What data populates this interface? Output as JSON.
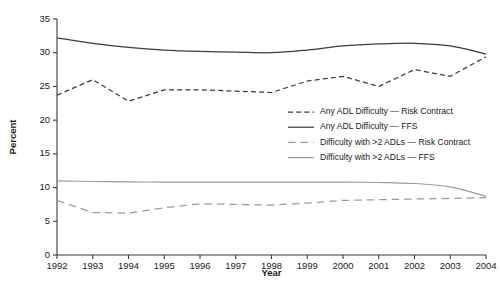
{
  "chart_data": {
    "type": "line",
    "title": "",
    "xlabel": "Year",
    "ylabel": "Percent",
    "x": [
      1992,
      1993,
      1994,
      1995,
      1996,
      1997,
      1998,
      1999,
      2000,
      2001,
      2002,
      2003,
      2004
    ],
    "xtick_labels": [
      "1992",
      "1993",
      "1994",
      "1995",
      "1996",
      "1997",
      "1998",
      "1999",
      "2000",
      "2001",
      "2002",
      "2003",
      "2004"
    ],
    "ytick_labels": [
      "0",
      "5",
      "10",
      "15",
      "20",
      "25",
      "30",
      "35"
    ],
    "yticks": [
      0,
      5,
      10,
      15,
      20,
      25,
      30,
      35
    ],
    "ylim": [
      0,
      35
    ],
    "xlim": [
      1992,
      2004
    ],
    "grid": false,
    "legend_position": "center-right-inside",
    "series": [
      {
        "name": "Any ADL Difficulty — Risk Contract",
        "style": "dashed-fine",
        "color": "#3b3b3b",
        "values": [
          23.7,
          26.0,
          22.8,
          24.5,
          24.5,
          24.3,
          24.1,
          25.8,
          26.5,
          25.0,
          27.5,
          26.5,
          29.4
        ]
      },
      {
        "name": "Any ADL Difficulty — FFS",
        "style": "solid",
        "color": "#3b3b3b",
        "values": [
          32.2,
          31.4,
          30.8,
          30.4,
          30.2,
          30.1,
          30.0,
          30.4,
          31.0,
          31.3,
          31.4,
          31.0,
          29.8
        ]
      },
      {
        "name": "Difficulty with >2 ADLs — Risk Contract",
        "style": "dashed-long",
        "color": "#9a9a9a",
        "values": [
          8.1,
          6.3,
          6.2,
          7.0,
          7.6,
          7.5,
          7.4,
          7.7,
          8.1,
          8.2,
          8.3,
          8.4,
          8.5
        ]
      },
      {
        "name": "Difficulty with >2 ADLs — FFS",
        "style": "solid-gray",
        "color": "#9a9a9a",
        "values": [
          11.0,
          10.9,
          10.85,
          10.8,
          10.8,
          10.8,
          10.8,
          10.8,
          10.8,
          10.75,
          10.6,
          10.1,
          8.7
        ]
      }
    ]
  },
  "legend": {
    "items": [
      {
        "label": "Any ADL Difficulty — Risk Contract"
      },
      {
        "label": "Any ADL Difficulty — FFS"
      },
      {
        "label": "Difficulty with >2 ADLs — Risk Contract"
      },
      {
        "label": "Difficulty with >2 ADLs — FFS"
      }
    ]
  }
}
